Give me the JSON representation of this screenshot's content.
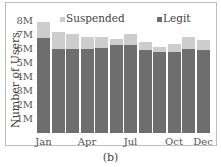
{
  "chart_data": {
    "type": "bar",
    "stacked": true,
    "title": "",
    "xlabel": "",
    "ylabel": "Number of Users",
    "ylim": [
      0,
      8000000
    ],
    "yticks": [
      "1M",
      "2M",
      "3M",
      "4M",
      "5M",
      "6M",
      "7M",
      "8M"
    ],
    "categories": [
      "Jan",
      "Feb",
      "Mar",
      "Apr",
      "May",
      "Jun",
      "Jul",
      "Aug",
      "Sep",
      "Oct",
      "Nov",
      "Dec"
    ],
    "xtick_labels": [
      "Jan",
      "Apr",
      "Jul",
      "Oct",
      "Dec"
    ],
    "series": [
      {
        "name": "Legit",
        "color": "#6e6e6e",
        "values": [
          6.8,
          6.0,
          6.0,
          6.0,
          6.1,
          6.3,
          6.3,
          5.9,
          5.8,
          5.8,
          6.0,
          5.9
        ]
      },
      {
        "name": "Suspended",
        "color": "#cdcdcd",
        "values": [
          1.1,
          1.2,
          1.05,
          0.85,
          0.75,
          0.4,
          0.75,
          0.6,
          0.35,
          0.55,
          0.85,
          0.75
        ]
      }
    ],
    "units": "millions",
    "legend": {
      "position": "top",
      "entries": [
        "Suspended",
        "Legit"
      ]
    },
    "grid": false
  },
  "caption": "(b)"
}
